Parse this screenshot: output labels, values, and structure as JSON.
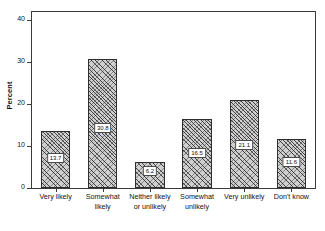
{
  "chart_data": {
    "type": "bar",
    "title": "",
    "subtitle": "",
    "xlabel": "",
    "ylabel": "Percent",
    "ylim": [
      0,
      42
    ],
    "yticks": [
      0,
      10,
      20,
      30,
      40
    ],
    "ytick_labels": [
      "0",
      "10",
      "20",
      "30",
      "40"
    ],
    "grid": false,
    "legend": null,
    "categories": [
      "Very likely",
      "Somewhat likely",
      "Neither likely or unlikely",
      "Somewhat unlikely",
      "Very unlikely",
      "Don't know"
    ],
    "category_lines": [
      [
        "Very likely"
      ],
      [
        "Somewhat",
        "likely"
      ],
      [
        "Neither likely",
        "or unlikely"
      ],
      [
        "Somewhat",
        "unlikely"
      ],
      [
        "Very unlikely"
      ],
      [
        "Don't know"
      ]
    ],
    "values": [
      13.7,
      30.8,
      6.2,
      16.5,
      21.1,
      11.6
    ],
    "value_labels": [
      "13.7",
      "30.8",
      "6.2",
      "16.5",
      "21.1",
      "11.6"
    ],
    "bar_fill": "#cfcfcf",
    "bar_edge": "#2e2e2e",
    "bar_hatch": "cross-hatch",
    "axis_color": "#3b3b3b"
  }
}
